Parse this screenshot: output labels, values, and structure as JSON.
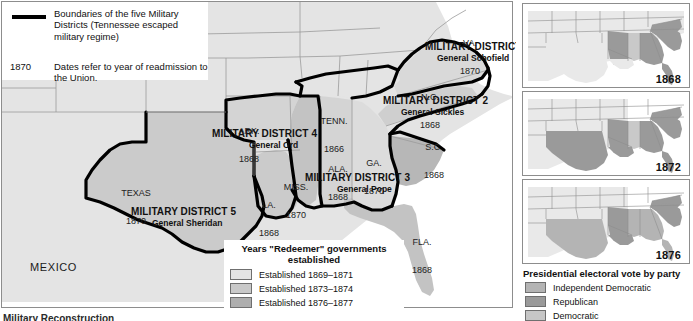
{
  "colors": {
    "land_light": "#e4e4e4",
    "land_mid": "#c9c9c9",
    "land_dark": "#aeaeae",
    "water": "#ffffff",
    "district_boundary": "#000000",
    "state_boundary": "#8d8d8d",
    "text": "#111111"
  },
  "key": {
    "boundary_swatch_name": "thick-black-line",
    "boundary_text": "Boundaries of the five\nMilitary Districts\n(Tennessee escaped\nmilitary regime)",
    "date_example": "1870",
    "date_text": "Dates refer to year of\nreadmission to the Union."
  },
  "districts": [
    {
      "id": 1,
      "name": "MILITARY DISTRICT 1",
      "general": "General Schofield"
    },
    {
      "id": 2,
      "name": "MILITARY DISTRICT 2",
      "general": "General Sickles"
    },
    {
      "id": 3,
      "name": "MILITARY DISTRICT 3",
      "general": "General Pope"
    },
    {
      "id": 4,
      "name": "MILITARY DISTRICT 4",
      "general": "General Ord"
    },
    {
      "id": 5,
      "name": "MILITARY DISTRICT 5",
      "general": "General Sheridan"
    }
  ],
  "states": [
    {
      "abbr": "VA.",
      "year": "1870"
    },
    {
      "abbr": "N.C.",
      "year": "1868"
    },
    {
      "abbr": "S.C.",
      "year": "1868"
    },
    {
      "abbr": "GA.",
      "year": "1870"
    },
    {
      "abbr": "FLA.",
      "year": "1868"
    },
    {
      "abbr": "ALA.",
      "year": "1868"
    },
    {
      "abbr": "MISS.",
      "year": "1870"
    },
    {
      "abbr": "ARK.",
      "year": "1868"
    },
    {
      "abbr": "LA.",
      "year": "1868"
    },
    {
      "abbr": "TEXAS",
      "year": "1870"
    },
    {
      "abbr": "TENN.",
      "year": "1866"
    }
  ],
  "country_label": "MEXICO",
  "redeemer_legend": {
    "title": "Years \"Redeemer\"\ngovernments established",
    "items": [
      {
        "label": "Established 1869–1871",
        "color": "#e4e4e4"
      },
      {
        "label": "Established 1873–1874",
        "color": "#c9c9c9"
      },
      {
        "label": "Established 1876–1877",
        "color": "#aeaeae"
      }
    ]
  },
  "insets": [
    {
      "year": "1868"
    },
    {
      "year": "1872"
    },
    {
      "year": "1876"
    }
  ],
  "party_legend": {
    "title": "Presidential electoral vote by party",
    "items": [
      {
        "label": "Independent Democratic",
        "color": "#b4b4b4"
      },
      {
        "label": "Republican",
        "color": "#9a9a9a"
      },
      {
        "label": "Democratic",
        "color": "#c6c6c6"
      }
    ]
  },
  "cut_caption": "Military Reconstruction"
}
